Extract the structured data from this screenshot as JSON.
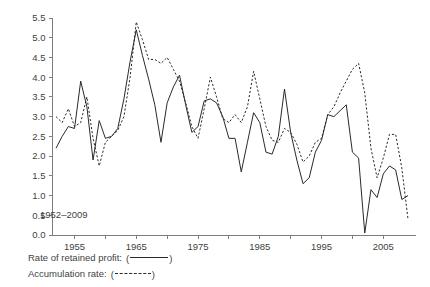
{
  "chart_data": {
    "type": "line",
    "title": "",
    "subtitle": "",
    "xlabel": "",
    "ylabel": "",
    "annotation": "1952–2009",
    "grid": false,
    "legend_position": "below-axes-left",
    "xlim": [
      1952,
      2009
    ],
    "ylim": [
      0.0,
      5.5
    ],
    "yticks": [
      "0.0",
      "0.5",
      "1.0",
      "1.5",
      "2.0",
      "2.5",
      "3.0",
      "3.5",
      "4.0",
      "4.5",
      "5.0",
      "5.5"
    ],
    "ytick_values": [
      0.0,
      0.5,
      1.0,
      1.5,
      2.0,
      2.5,
      3.0,
      3.5,
      4.0,
      4.5,
      5.0,
      5.5
    ],
    "xticks_major": [
      "1955",
      "1965",
      "1975",
      "1985",
      "1995",
      "2005"
    ],
    "xtick_major_values": [
      1955,
      1965,
      1975,
      1985,
      1995,
      2005
    ],
    "xtick_minor_values": [
      1960,
      1970,
      1980,
      1990,
      2000
    ],
    "x": [
      1952,
      1953,
      1954,
      1955,
      1956,
      1957,
      1958,
      1959,
      1960,
      1961,
      1962,
      1963,
      1964,
      1965,
      1966,
      1967,
      1968,
      1969,
      1970,
      1971,
      1972,
      1973,
      1974,
      1975,
      1976,
      1977,
      1978,
      1979,
      1980,
      1981,
      1982,
      1983,
      1984,
      1985,
      1986,
      1987,
      1988,
      1989,
      1990,
      1991,
      1992,
      1993,
      1994,
      1995,
      1996,
      1997,
      1998,
      1999,
      2000,
      2001,
      2002,
      2003,
      2004,
      2005,
      2006,
      2007,
      2008,
      2009
    ],
    "series": [
      {
        "name": "Rate of retained profit",
        "style": "solid",
        "values": [
          2.2,
          2.5,
          2.75,
          2.7,
          3.9,
          3.25,
          1.9,
          2.9,
          2.45,
          2.5,
          2.7,
          3.45,
          4.4,
          5.2,
          4.55,
          3.95,
          3.3,
          2.35,
          3.35,
          3.75,
          4.05,
          3.3,
          2.6,
          2.75,
          3.4,
          3.45,
          3.35,
          3.0,
          2.45,
          2.45,
          1.6,
          2.35,
          3.1,
          2.85,
          2.1,
          2.05,
          2.5,
          3.7,
          2.6,
          1.9,
          1.3,
          1.45,
          2.1,
          2.4,
          3.05,
          3.0,
          3.15,
          3.3,
          2.1,
          1.95,
          0.05,
          1.15,
          0.95,
          1.55,
          1.75,
          1.65,
          0.9,
          1.0
        ]
      },
      {
        "name": "Accumulation rate",
        "style": "dashed",
        "values": [
          3.0,
          2.85,
          3.2,
          2.75,
          2.85,
          3.5,
          2.45,
          1.75,
          2.35,
          2.5,
          2.65,
          3.0,
          4.0,
          5.4,
          4.95,
          4.45,
          4.45,
          4.35,
          4.5,
          4.2,
          3.9,
          3.35,
          2.75,
          2.45,
          3.2,
          4.0,
          3.5,
          2.95,
          2.85,
          3.05,
          2.85,
          3.25,
          4.15,
          3.45,
          2.75,
          2.4,
          2.35,
          2.7,
          2.6,
          2.3,
          1.85,
          2.0,
          2.35,
          2.45,
          3.05,
          3.25,
          3.6,
          3.9,
          4.2,
          4.35,
          3.6,
          2.2,
          1.45,
          1.95,
          2.55,
          2.55,
          1.7,
          0.4
        ]
      }
    ]
  },
  "legend": {
    "rows": [
      {
        "label": "Rate of retained profit:",
        "open_paren": "(",
        "close_paren": ")",
        "style": "solid"
      },
      {
        "label": "Accumulation rate:",
        "open_paren": "(",
        "close_paren": ")",
        "style": "dashed"
      }
    ]
  },
  "colors": {
    "axis": "#7d7d7d",
    "line": "#2a2a2a",
    "text": "#3f3f3f",
    "background": "#ffffff"
  }
}
